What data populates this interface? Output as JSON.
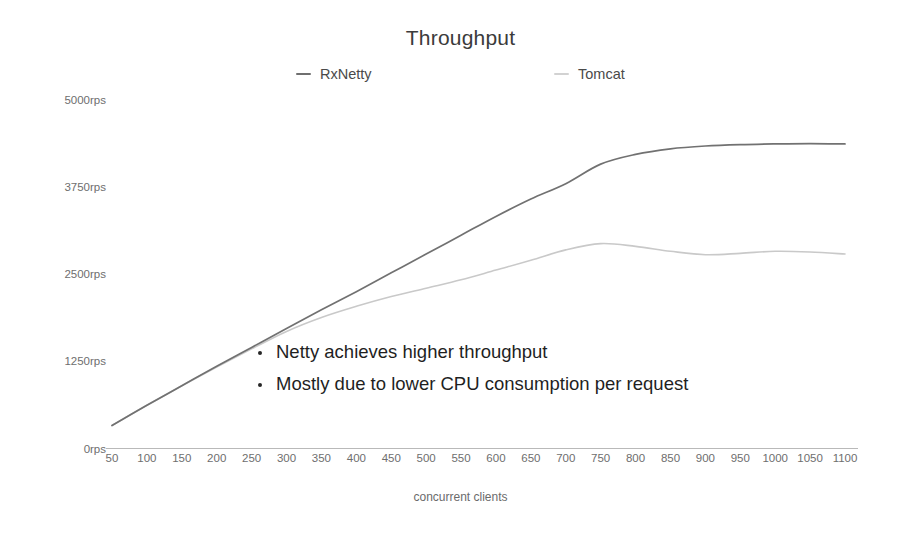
{
  "chart_data": {
    "type": "line",
    "title": "Throughput",
    "xlabel": "concurrent clients",
    "ylabel": "",
    "grid": false,
    "legend_position": "top-center",
    "xlim": [
      50,
      1100
    ],
    "ylim": [
      0,
      5000
    ],
    "ytick_labels": [
      "0rps",
      "1250rps",
      "2500rps",
      "3750rps",
      "5000rps"
    ],
    "ytick_values": [
      0,
      1250,
      2500,
      3750,
      5000
    ],
    "xtick_labels": [
      "50",
      "100",
      "150",
      "200",
      "250",
      "300",
      "350",
      "400",
      "450",
      "500",
      "550",
      "600",
      "650",
      "700",
      "750",
      "800",
      "850",
      "900",
      "950",
      "1000",
      "1050",
      "1100"
    ],
    "x": [
      50,
      100,
      150,
      200,
      250,
      300,
      350,
      400,
      450,
      500,
      550,
      600,
      650,
      700,
      750,
      800,
      850,
      900,
      950,
      1000,
      1050,
      1100
    ],
    "series": [
      {
        "name": "RxNetty",
        "color": "#6f6f6f",
        "values": [
          330,
          620,
          900,
          1180,
          1450,
          1720,
          1990,
          2250,
          2520,
          2790,
          3060,
          3330,
          3580,
          3800,
          4080,
          4220,
          4300,
          4340,
          4360,
          4370,
          4375,
          4370
        ]
      },
      {
        "name": "Tomcat",
        "color": "#c6c6c6",
        "values": [
          330,
          620,
          900,
          1170,
          1430,
          1680,
          1880,
          2040,
          2180,
          2300,
          2420,
          2560,
          2700,
          2850,
          2940,
          2900,
          2830,
          2780,
          2800,
          2830,
          2820,
          2790
        ]
      }
    ],
    "annotations": {
      "bullets": [
        "Netty achieves higher throughput",
        "Mostly due to lower CPU consumption per request"
      ]
    }
  },
  "colors": {
    "background": "#ffffff",
    "title_text": "#3b3b3b",
    "tick_text": "#6e6e6e",
    "bullet_text": "#1f1f1f",
    "axis_line": "#b9b9b9",
    "rxnetty_line": "#6f6f6f",
    "tomcat_line": "#c6c6c6"
  }
}
